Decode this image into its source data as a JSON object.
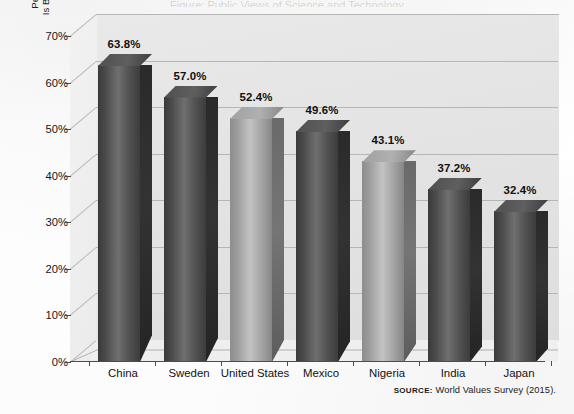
{
  "figure": {
    "y_axis_title_line1": "Percentage of Adults Who Say That the World",
    "y_axis_title_line2": "Is Better Off Because of Science and Technology",
    "source_label": "SOURCE:",
    "source_text": "World Values Survey (2015).",
    "title_remnant": "Figure: Public Views of Science and Technology"
  },
  "chart_data": {
    "type": "bar",
    "title": "",
    "subtitle": "",
    "xlabel": "",
    "ylabel": "Percentage of Adults Who Say That the World Is Better Off Because of Science and Technology",
    "ylim": [
      0,
      70
    ],
    "ytick_values": [
      0,
      10,
      20,
      30,
      40,
      50,
      60,
      70
    ],
    "ytick_labels": [
      "0%",
      "10%",
      "20%",
      "30%",
      "40%",
      "50%",
      "60%",
      "70%"
    ],
    "grid": true,
    "legend": "none",
    "three_d": true,
    "categories": [
      "China",
      "Sweden",
      "United States",
      "Mexico",
      "Nigeria",
      "India",
      "Japan"
    ],
    "values": [
      63.8,
      57.0,
      52.4,
      49.6,
      43.1,
      37.2,
      32.4
    ],
    "data_labels": [
      "63.8%",
      "57.0%",
      "52.4%",
      "49.6%",
      "43.1%",
      "37.2%",
      "32.4%"
    ],
    "bar_shades": [
      "dark",
      "dark",
      "light",
      "dark",
      "light",
      "dark",
      "dark"
    ],
    "colors": {
      "bar_dark": "#4b4b4b",
      "bar_light": "#a8a8a8",
      "plot_background": "#e6e6e6",
      "gridline": "#b6b6b6",
      "text": "#111111"
    }
  }
}
